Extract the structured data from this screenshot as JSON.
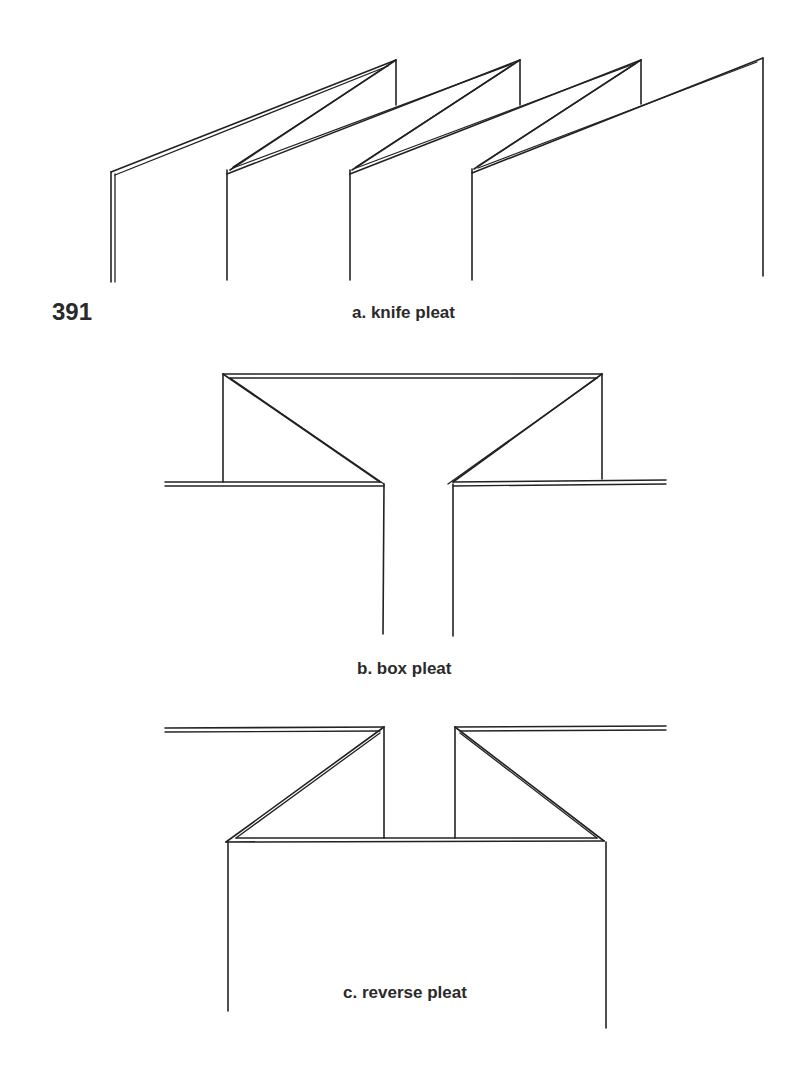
{
  "figure": {
    "number": "391",
    "panels": [
      {
        "id": "a",
        "caption": "a. knife pleat"
      },
      {
        "id": "b",
        "caption": "b. box pleat"
      },
      {
        "id": "c",
        "caption": "c. reverse pleat"
      }
    ]
  },
  "colors": {
    "line": "#222222",
    "text": "#2a2a2a",
    "background": "#ffffff"
  }
}
